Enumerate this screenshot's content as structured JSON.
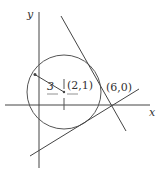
{
  "diagram": {
    "axes": {
      "x_label": "x",
      "y_label": "y"
    },
    "circle": {
      "center_label": "(2,1)",
      "radius_label": "3"
    },
    "point": {
      "label": "(6,0)"
    },
    "caption": "",
    "colors": {
      "stroke": "#333333",
      "background": "#ffffff"
    }
  }
}
